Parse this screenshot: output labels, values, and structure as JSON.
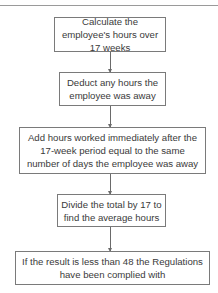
{
  "flowchart": {
    "steps": [
      {
        "label": "Calculate the employee's hours over 17 weeks"
      },
      {
        "label": "Deduct any hours the employee was away"
      },
      {
        "label": "Add hours worked immediately after the 17-week period equal to the same number of days the employee was away"
      },
      {
        "label": "Divide the total by 17 to find the average hours"
      },
      {
        "label": "If the result is less than 48 the Regulations have been complied with"
      }
    ],
    "colors": {
      "border": "#7a7a7a",
      "text": "#3a3a3a",
      "rule": "#9a9a9a"
    }
  }
}
